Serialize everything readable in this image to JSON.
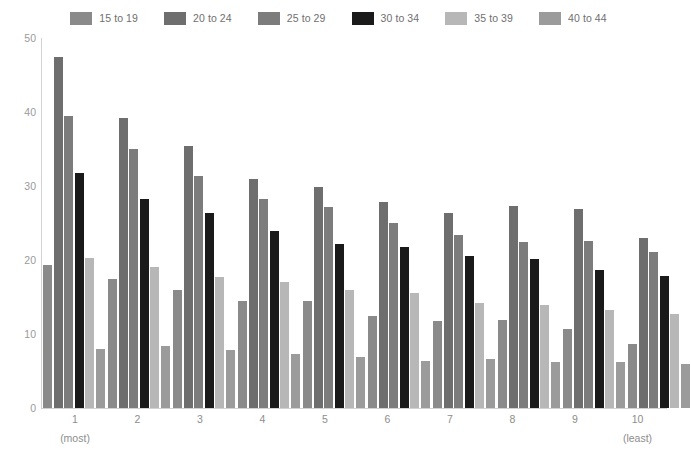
{
  "legend": {
    "position": "top-center",
    "entries": [
      {
        "label": "15 to 19",
        "color": "#8a8a8a"
      },
      {
        "label": "20 to 24",
        "color": "#6e6e6e"
      },
      {
        "label": "25 to 29",
        "color": "#7c7c7c"
      },
      {
        "label": "30 to 34",
        "color": "#1a1a1a"
      },
      {
        "label": "35 to 39",
        "color": "#b7b7b7"
      },
      {
        "label": "40 to 44",
        "color": "#9b9b9b"
      }
    ]
  },
  "axes": {
    "y_ticks": [
      "0",
      "10",
      "20",
      "30",
      "40",
      "50"
    ],
    "x_labels": [
      "1",
      "2",
      "3",
      "4",
      "5",
      "6",
      "7",
      "8",
      "9",
      "10"
    ],
    "x_sublabel_first": "(most)",
    "x_sublabel_last": "(least)",
    "axis_color": "#d2d2d2",
    "tick_text_color": "#8d8d8d"
  },
  "chart_data": {
    "type": "bar",
    "title": "",
    "subtitle": "",
    "xlabel": "",
    "ylabel": "",
    "ylim": [
      0,
      50
    ],
    "ytick_step": 10,
    "grid": false,
    "legend_position": "top-center",
    "categories": [
      "1",
      "2",
      "3",
      "4",
      "5",
      "6",
      "7",
      "8",
      "9",
      "10"
    ],
    "category_annotations": {
      "1": "(most)",
      "10": "(least)"
    },
    "series": [
      {
        "name": "15 to 19",
        "color": "#8a8a8a",
        "values": [
          19.3,
          17.5,
          16.0,
          14.5,
          14.5,
          12.4,
          11.7,
          11.9,
          10.7,
          8.7
        ]
      },
      {
        "name": "20 to 24",
        "color": "#6e6e6e",
        "values": [
          47.5,
          39.2,
          35.4,
          30.9,
          29.9,
          27.8,
          26.3,
          27.3,
          26.9,
          23.0
        ]
      },
      {
        "name": "25 to 29",
        "color": "#7c7c7c",
        "values": [
          39.5,
          35.0,
          31.4,
          28.2,
          27.2,
          25.0,
          23.4,
          22.5,
          22.6,
          21.1
        ]
      },
      {
        "name": "30 to 34",
        "color": "#1a1a1a",
        "values": [
          31.8,
          28.3,
          26.4,
          23.9,
          22.2,
          21.8,
          20.6,
          20.1,
          18.6,
          17.8
        ]
      },
      {
        "name": "35 to 39",
        "color": "#b7b7b7",
        "values": [
          20.3,
          19.0,
          17.7,
          17.0,
          15.9,
          15.5,
          14.2,
          13.9,
          13.3,
          12.7
        ]
      },
      {
        "name": "40 to 44",
        "color": "#9b9b9b",
        "values": [
          8.0,
          8.4,
          7.8,
          7.3,
          6.9,
          6.3,
          6.6,
          6.2,
          6.2,
          5.9
        ]
      }
    ]
  }
}
